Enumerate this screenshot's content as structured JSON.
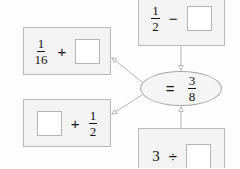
{
  "diagram": {
    "background_color": "#fefefe",
    "box_fill_color": "#f3f3f3",
    "box_border_color": "#b9b9b9",
    "ellipse_fill_color": "#f5f5f5",
    "connector_color": "#b0b0b0",
    "nodes": {
      "top_left": {
        "name": "top-left-expression",
        "operand_1_numerator": "1",
        "operand_1_denominator": "16",
        "operator": "+",
        "operand_2": "",
        "operand_2_is_blank": true
      },
      "bottom_left": {
        "name": "bottom-left-expression",
        "operand_1": "",
        "operand_1_is_blank": true,
        "operator": "+",
        "operand_2_numerator": "1",
        "operand_2_denominator": "2"
      },
      "top_right": {
        "name": "top-right-expression",
        "operand_1_numerator": "1",
        "operand_1_denominator": "2",
        "operator": "−",
        "operand_2": "",
        "operand_2_is_blank": true
      },
      "bottom_right": {
        "name": "bottom-right-expression",
        "operand_1": "3",
        "operator": "÷",
        "operand_2": "",
        "operand_2_is_blank": true
      },
      "center": {
        "name": "result-ellipse",
        "operator": "=",
        "result_numerator": "3",
        "result_denominator": "8"
      }
    },
    "connectors": [
      {
        "name": "connector-center-to-top-left",
        "from": "center",
        "to": "top_left",
        "arrow_at": "top_left"
      },
      {
        "name": "connector-center-to-bottom-left",
        "from": "center",
        "to": "bottom_left",
        "arrow_at": "bottom_left"
      },
      {
        "name": "connector-top-right-to-center",
        "from": "top_right",
        "to": "center",
        "arrow_at": "center"
      },
      {
        "name": "connector-bottom-right-to-center",
        "from": "bottom_right",
        "to": "center",
        "arrow_at": "center"
      }
    ]
  }
}
